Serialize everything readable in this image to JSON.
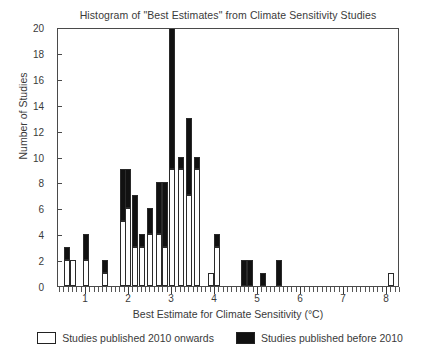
{
  "chart_data": {
    "type": "bar",
    "title": "Histogram of \"Best Estimates\" from Climate Sensitivity Studies",
    "xlabel": "Best Estimate for Climate Sensitivity (°C)",
    "ylabel": "Number of Studies",
    "xlim": [
      0.35,
      8.3
    ],
    "ylim": [
      0,
      20
    ],
    "bin_width": 0.1,
    "grid": false,
    "legend_position": "below-axes",
    "y_ticks": [
      0,
      2,
      4,
      6,
      8,
      10,
      12,
      14,
      16,
      18,
      20
    ],
    "x_ticks": [
      1,
      2,
      3,
      4,
      5,
      6,
      7,
      8
    ],
    "x_minor_tick_step": 0.1,
    "series": [
      {
        "name": "Studies published 2010 onwards",
        "color": "#ffffff",
        "edge": "#2a2a2a"
      },
      {
        "name": "Studies published before 2010",
        "color": "#111111",
        "edge": "#2a2a2a"
      }
    ],
    "stacked": true,
    "bars": [
      {
        "x": 0.55,
        "new": 2,
        "old": 1,
        "total": 3
      },
      {
        "x": 0.7,
        "new": 2,
        "old": 0,
        "total": 2
      },
      {
        "x": 1.0,
        "new": 2,
        "old": 2,
        "total": 4
      },
      {
        "x": 1.45,
        "new": 1,
        "old": 1,
        "total": 2
      },
      {
        "x": 1.85,
        "new": 5,
        "old": 4,
        "total": 9
      },
      {
        "x": 1.97,
        "new": 6,
        "old": 3,
        "total": 9
      },
      {
        "x": 2.15,
        "new": 3,
        "old": 4,
        "total": 7
      },
      {
        "x": 2.3,
        "new": 3,
        "old": 1,
        "total": 4
      },
      {
        "x": 2.5,
        "new": 4,
        "old": 2,
        "total": 6
      },
      {
        "x": 2.7,
        "new": 4,
        "old": 4,
        "total": 8
      },
      {
        "x": 2.83,
        "new": 3,
        "old": 5,
        "total": 8
      },
      {
        "x": 3.0,
        "new": 9,
        "old": 11,
        "total": 20
      },
      {
        "x": 3.2,
        "new": 9,
        "old": 1,
        "total": 10
      },
      {
        "x": 3.4,
        "new": 7,
        "old": 6,
        "total": 13
      },
      {
        "x": 3.58,
        "new": 9,
        "old": 1,
        "total": 10
      },
      {
        "x": 3.9,
        "new": 1,
        "old": 0,
        "total": 1
      },
      {
        "x": 4.05,
        "new": 3,
        "old": 1,
        "total": 4
      },
      {
        "x": 4.68,
        "new": 0,
        "old": 2,
        "total": 2
      },
      {
        "x": 4.82,
        "new": 0,
        "old": 2,
        "total": 2
      },
      {
        "x": 5.12,
        "new": 0,
        "old": 1,
        "total": 1
      },
      {
        "x": 5.48,
        "new": 0,
        "old": 2,
        "total": 2
      },
      {
        "x": 8.1,
        "new": 1,
        "old": 0,
        "total": 1
      }
    ],
    "note_clipped_bar": "Bar at 3.0 reaches the top of the axis at 20"
  },
  "legend": {
    "entries": [
      {
        "label": "Studies published 2010 onwards",
        "style": "new"
      },
      {
        "label": "Studies published before 2010",
        "style": "old"
      }
    ]
  }
}
